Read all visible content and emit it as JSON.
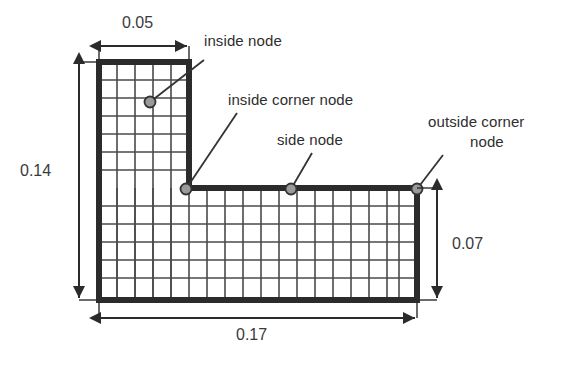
{
  "figure": {
    "kind": "finite-element-mesh-diagram",
    "shape": "L-shaped domain",
    "background_color": "#ffffff",
    "mesh_line_color": "#3d3d3d",
    "boundary_color": "#2b2b2b",
    "node_fill_color": "#9a9a9a",
    "node_stroke_color": "#333333",
    "dimension_color": "#3a3a3a",
    "label_color": "#2e2e2e"
  },
  "labels": [
    {
      "id": "inside-node",
      "text": "inside node",
      "x": 204,
      "y": 41
    },
    {
      "id": "inside-corner-node",
      "text": "inside corner node",
      "x": 228,
      "y": 100
    },
    {
      "id": "side-node",
      "text": "side node",
      "x": 277,
      "y": 140
    },
    {
      "id": "outside-corner-node",
      "text": "outside corner",
      "x": 430,
      "y": 122
    },
    {
      "id": "outside-corner-node-2",
      "text": "node",
      "x": 470,
      "y": 142
    }
  ],
  "dimensions": [
    {
      "id": "width-top",
      "value": "0.05",
      "orientation": "horizontal",
      "x": 128,
      "y": 22
    },
    {
      "id": "height-left",
      "value": "0.14",
      "orientation": "vertical",
      "x": 22,
      "y": 164
    },
    {
      "id": "height-right",
      "value": "0.07",
      "orientation": "vertical",
      "x": 452,
      "y": 243
    },
    {
      "id": "width-bottom",
      "value": "0.17",
      "orientation": "horizontal",
      "x": 242,
      "y": 334
    }
  ],
  "nodes": [
    {
      "id": "inside-node",
      "type": "inside",
      "cx": 150,
      "cy": 102
    },
    {
      "id": "inside-corner-node",
      "type": "inside-corner",
      "cx": 186,
      "cy": 189
    },
    {
      "id": "side-node",
      "type": "side",
      "cx": 291,
      "cy": 189
    },
    {
      "id": "outside-corner-node",
      "type": "outside-corner",
      "cx": 417,
      "cy": 189
    }
  ],
  "geometry": {
    "vertical_arm": {
      "x": 99,
      "y": 62,
      "width": 90,
      "height": 238,
      "cols": 5,
      "rows": 13
    },
    "horizontal_arm": {
      "x": 99,
      "y": 188,
      "width": 318,
      "height": 112,
      "cols": 17,
      "rows": 6
    },
    "cell_size": 18
  }
}
